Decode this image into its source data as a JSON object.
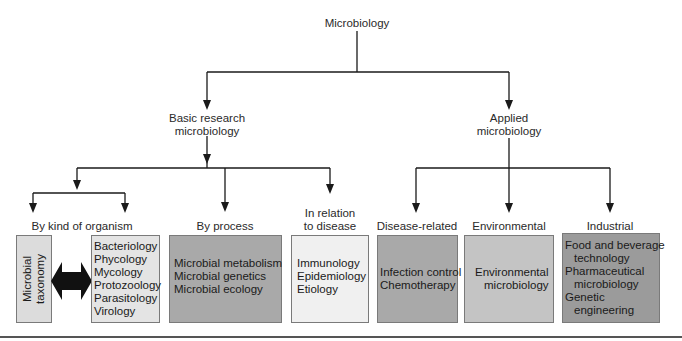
{
  "diagram": {
    "root": "Microbiology",
    "branches": {
      "basic": {
        "line1": "Basic research",
        "line2": "microbiology"
      },
      "applied": {
        "line1": "Applied",
        "line2": "microbiology"
      }
    },
    "categories": {
      "by_kind": "By kind of organism",
      "by_process": "By process",
      "in_relation": {
        "line1": "In relation",
        "line2": "to disease"
      },
      "disease_related": "Disease-related",
      "environmental": "Environmental",
      "industrial": "Industrial"
    },
    "boxes": {
      "taxonomy": {
        "line1": "Microbial",
        "line2": "taxonomy",
        "color": "#dcdcdc"
      },
      "organisms": {
        "color": "#e4e4e4",
        "items": [
          "Bacteriology",
          "Phycology",
          "Mycology",
          "Protozoology",
          "Parasitology",
          "Virology"
        ]
      },
      "process": {
        "color": "#a9a9a9",
        "items": [
          "Microbial metabolism",
          "Microbial genetics",
          "Microbial ecology"
        ]
      },
      "disease": {
        "color": "#f0f0f0",
        "items": [
          "Immunology",
          "Epidemiology",
          "Etiology"
        ]
      },
      "disease_related": {
        "color": "#a9a9a9",
        "items": [
          "Infection control",
          "Chemotherapy"
        ]
      },
      "environmental": {
        "color": "#c4c4c4",
        "items": [
          "Environmental",
          "microbiology"
        ]
      },
      "industrial": {
        "color": "#9b9b9b",
        "items": [
          "Food and beverage",
          "technology",
          "Pharmaceutical",
          "microbiology",
          "Genetic",
          "engineering"
        ]
      }
    },
    "icons": {
      "double_arrow": "double-headed-arrow-icon"
    },
    "colors": {
      "line": "#1a1a1a",
      "border": "#7a7a7a",
      "bottom_rule": "#555555"
    }
  }
}
